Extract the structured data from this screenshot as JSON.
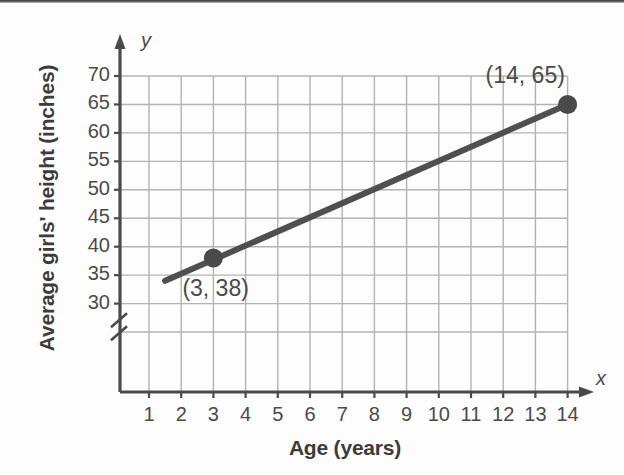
{
  "chart_data": {
    "type": "line",
    "title": "",
    "xlabel": "Age (years)",
    "ylabel": "Average girls' height (inches)",
    "x_axis_letter": "x",
    "y_axis_letter": "y",
    "xlim": [
      0,
      14.6
    ],
    "ylim": [
      27.5,
      71.5
    ],
    "y_axis_break": true,
    "grid": true,
    "legend": "none",
    "x_ticks": [
      "1",
      "2",
      "3",
      "4",
      "5",
      "6",
      "7",
      "8",
      "9",
      "10",
      "11",
      "12",
      "13",
      "14"
    ],
    "x_tick_values": [
      1,
      2,
      3,
      4,
      5,
      6,
      7,
      8,
      9,
      10,
      11,
      12,
      13,
      14
    ],
    "y_ticks": [
      "30",
      "35",
      "40",
      "45",
      "50",
      "55",
      "60",
      "65",
      "70"
    ],
    "y_tick_values": [
      30,
      35,
      40,
      45,
      50,
      55,
      60,
      65,
      70
    ],
    "series": [
      {
        "name": "Average girls' height",
        "x": [
          1.5,
          14
        ],
        "y": [
          34,
          65
        ],
        "line_color": "#4f4f4f",
        "line_width": 6
      }
    ],
    "points": [
      {
        "x": 3,
        "y": 38,
        "label": "(3, 38)",
        "label_position": "below-right"
      },
      {
        "x": 14,
        "y": 65,
        "label": "(14, 65)",
        "label_position": "above-left"
      }
    ],
    "marker_color": "#4a4a4a",
    "grid_color": "#b3b3b3",
    "axis_color": "#4a4a4a"
  }
}
